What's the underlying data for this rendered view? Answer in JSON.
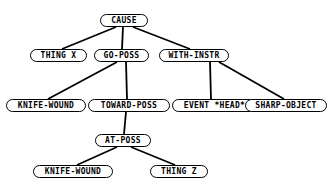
{
  "diagram": {
    "style": {
      "background": "#ffffff",
      "node_fill": "#ffffff",
      "node_stroke": "#000000",
      "edge_color": "#000000",
      "text_color": "#000000"
    },
    "nodes": [
      {
        "id": "cause",
        "label": "CAUSE",
        "x": 100,
        "y": 14,
        "w": 48,
        "h": 13,
        "font": 8
      },
      {
        "id": "thing-x",
        "label": "THING X",
        "x": 30,
        "y": 49,
        "w": 57,
        "h": 13,
        "font": 8
      },
      {
        "id": "go-poss",
        "label": "GO-POSS",
        "x": 94,
        "y": 49,
        "w": 55,
        "h": 13,
        "font": 8
      },
      {
        "id": "with-instr",
        "label": "WITH-INSTR",
        "x": 159,
        "y": 49,
        "w": 70,
        "h": 13,
        "font": 8
      },
      {
        "id": "knife-wound-1",
        "label": "KNIFE-WOUND",
        "x": 6,
        "y": 99,
        "w": 80,
        "h": 13,
        "font": 8
      },
      {
        "id": "toward-poss",
        "label": "TOWARD-POSS",
        "x": 88,
        "y": 99,
        "w": 82,
        "h": 13,
        "font": 8
      },
      {
        "id": "event-head",
        "label": "EVENT *HEAD*",
        "x": 172,
        "y": 99,
        "w": 85,
        "h": 13,
        "font": 8
      },
      {
        "id": "sharp-object",
        "label": "SHARP-OBJECT",
        "x": 245,
        "y": 99,
        "w": 82,
        "h": 13,
        "font": 8
      },
      {
        "id": "at-poss",
        "label": "AT-POSS",
        "x": 95,
        "y": 134,
        "w": 56,
        "h": 13,
        "font": 8
      },
      {
        "id": "knife-wound-2",
        "label": "KNIFE-WOUND",
        "x": 33,
        "y": 165,
        "w": 80,
        "h": 13,
        "font": 8
      },
      {
        "id": "thing-z",
        "label": "THING Z",
        "x": 150,
        "y": 165,
        "w": 58,
        "h": 13,
        "font": 8
      }
    ],
    "edges": [
      {
        "id": "cause-thing-x",
        "from": "cause",
        "to": "thing-x",
        "x1": 116,
        "y1": 27,
        "x2": 62,
        "y2": 49
      },
      {
        "id": "cause-go-poss",
        "from": "cause",
        "to": "go-poss",
        "x1": 123,
        "y1": 27,
        "x2": 122,
        "y2": 49
      },
      {
        "id": "cause-with-instr",
        "from": "cause",
        "to": "with-instr",
        "x1": 133,
        "y1": 27,
        "x2": 190,
        "y2": 49
      },
      {
        "id": "go-poss-knife-wound",
        "from": "go-poss",
        "to": "knife-wound-1",
        "x1": 117,
        "y1": 62,
        "x2": 48,
        "y2": 99
      },
      {
        "id": "go-poss-toward-poss",
        "from": "go-poss",
        "to": "toward-poss",
        "x1": 126,
        "y1": 62,
        "x2": 127,
        "y2": 99
      },
      {
        "id": "with-instr-event-head",
        "from": "with-instr",
        "to": "event-head",
        "x1": 210,
        "y1": 62,
        "x2": 211,
        "y2": 99
      },
      {
        "id": "with-instr-sharp-object",
        "from": "with-instr",
        "to": "sharp-object",
        "x1": 219,
        "y1": 62,
        "x2": 284,
        "y2": 99
      },
      {
        "id": "toward-poss-at-poss",
        "from": "toward-poss",
        "to": "at-poss",
        "x1": 126,
        "y1": 112,
        "x2": 124,
        "y2": 134
      },
      {
        "id": "at-poss-knife-wound",
        "from": "at-poss",
        "to": "knife-wound-2",
        "x1": 117,
        "y1": 147,
        "x2": 77,
        "y2": 165
      },
      {
        "id": "at-poss-thing-z",
        "from": "at-poss",
        "to": "thing-z",
        "x1": 131,
        "y1": 147,
        "x2": 175,
        "y2": 165
      }
    ]
  }
}
